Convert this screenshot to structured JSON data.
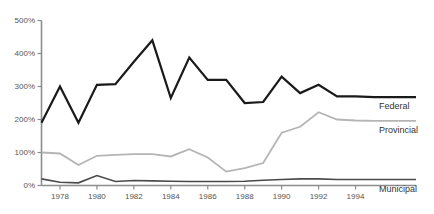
{
  "chart_data": {
    "type": "line",
    "title": "",
    "subtitle": "",
    "xlabel": "",
    "ylabel": "",
    "grid": false,
    "legend_position": "right-inline",
    "x": [
      1977,
      1978,
      1979,
      1980,
      1981,
      1982,
      1983,
      1984,
      1985,
      1986,
      1987,
      1988,
      1989,
      1990,
      1991,
      1992,
      1993,
      1994,
      1995
    ],
    "xlim": [
      1977,
      1995
    ],
    "ylim": [
      0,
      500
    ],
    "ytick_values": [
      0,
      100,
      200,
      300,
      400,
      500
    ],
    "ytick_labels": [
      "0%",
      "100%",
      "200%",
      "300%",
      "400%",
      "500%"
    ],
    "xtick_values": [
      1978,
      1980,
      1982,
      1984,
      1986,
      1988,
      1990,
      1992,
      1994
    ],
    "xtick_labels": [
      "1978",
      "1980",
      "1982",
      "1984",
      "1986",
      "1988",
      "1990",
      "1992",
      "1994"
    ],
    "series": [
      {
        "name": "Federal",
        "color": "#1a1a1a",
        "width": 2.2,
        "values": [
          190,
          300,
          190,
          305,
          307,
          375,
          440,
          265,
          388,
          320,
          320,
          250,
          253,
          330,
          280,
          305,
          270,
          270,
          268
        ]
      },
      {
        "name": "Provincial",
        "color": "#b5b5b5",
        "width": 1.8,
        "values": [
          100,
          97,
          62,
          90,
          93,
          95,
          95,
          88,
          110,
          85,
          42,
          53,
          68,
          160,
          178,
          222,
          200,
          197,
          196
        ]
      },
      {
        "name": "Municipal",
        "color": "#4a4a4a",
        "width": 1.6,
        "values": [
          20,
          10,
          8,
          30,
          12,
          15,
          14,
          13,
          12,
          12,
          12,
          13,
          16,
          18,
          20,
          20,
          18,
          18,
          18
        ]
      }
    ]
  },
  "legend": {
    "items": [
      {
        "label": "Federal",
        "color": "#1a1a1a"
      },
      {
        "label": "Provincial",
        "color": "#b5b5b5"
      },
      {
        "label": "Municipal",
        "color": "#4a4a4a"
      }
    ]
  },
  "axis": {
    "y_axis_color": "#8c8c8c",
    "x_axis_color": "#8c8c8c",
    "tick_color": "#8c8c8c"
  }
}
